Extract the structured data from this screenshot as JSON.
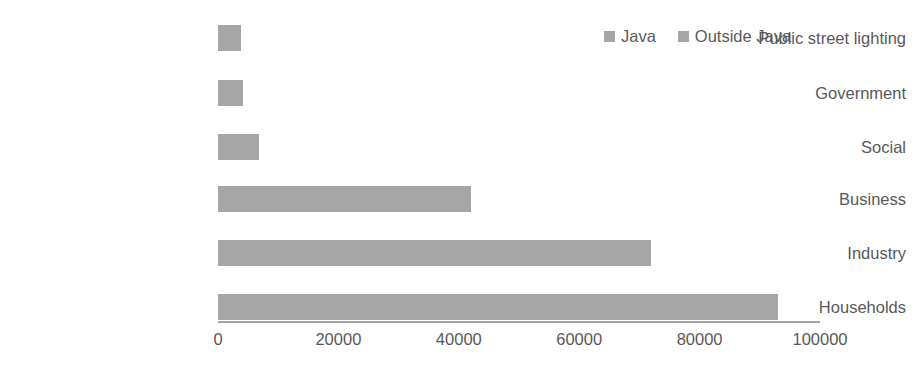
{
  "chart_data": {
    "type": "bar",
    "orientation": "horizontal",
    "title": "",
    "xlabel": "",
    "ylabel": "",
    "xlim": [
      0,
      100000
    ],
    "grid": false,
    "legend_position": "top-right",
    "categories": [
      "Public street lighting",
      "Government",
      "Social",
      "Business",
      "Industry",
      "Households"
    ],
    "series": [
      {
        "name": "Java",
        "color": "#a6a6a6",
        "values": [
          3800,
          4200,
          6800,
          42000,
          72000,
          93000
        ]
      }
    ],
    "legend": [
      {
        "label": "Java",
        "color": "#a6a6a6"
      },
      {
        "label": "Outside Java",
        "color": "#a6a6a6"
      }
    ],
    "xticks": [
      0,
      20000,
      40000,
      60000,
      80000,
      100000
    ],
    "xtick_labels": [
      "0",
      "20000",
      "40000",
      "60000",
      "80000",
      "100000"
    ]
  },
  "axis": {
    "line_color": "#a3a3a3"
  }
}
